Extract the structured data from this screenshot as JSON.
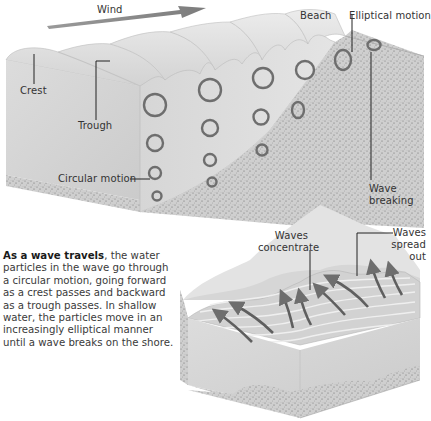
{
  "diagram": {
    "top_panel": {
      "title": "Wave motion cross-section",
      "labels": {
        "wind": "Wind",
        "beach": "Beach",
        "elliptical_motion": "Elliptical motion",
        "crest": "Crest",
        "trough": "Trough",
        "circular_motion": "Circular motion",
        "wave_breaking_line1": "Wave",
        "wave_breaking_line2": "breaking"
      }
    },
    "bottom_panel": {
      "title": "Wave refraction block",
      "labels": {
        "waves_concentrate_line1": "Waves",
        "waves_concentrate_line2": "concentrate",
        "waves_spread_line1": "Waves",
        "waves_spread_line2": "spread",
        "waves_spread_line3": "out"
      }
    },
    "caption": {
      "lead": "As a wave travels",
      "body": ", the water particles in the wave go through a circular motion, going forward as a crest passes and backward as a trough passes. In shallow water, the particles move in an increasingly elliptical manner until a wave breaks on the shore."
    },
    "colors": {
      "water_light": "#e6e6e6",
      "water_mid": "#cfcfcf",
      "sand": "#c9c9c9",
      "arrow": "#6e6e6e",
      "leader_line": "#222222"
    }
  }
}
